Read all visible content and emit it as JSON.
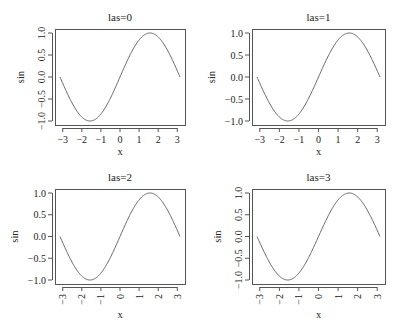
{
  "figure": {
    "width": 398,
    "height": 332,
    "background": "#ffffff",
    "line_color": "#666666",
    "axis_color": "#555555"
  },
  "chart_data": [
    {
      "type": "line",
      "title": "las=0",
      "xlabel": "x",
      "ylabel": "sin",
      "function": "sin(x)",
      "xlim": [
        -3.14159,
        3.14159
      ],
      "ylim": [
        -1,
        1
      ],
      "x_ticks": [
        "-3",
        "-2",
        "-1",
        "0",
        "1",
        "2",
        "3"
      ],
      "y_ticks": [
        "-1.0",
        "-0.5",
        "0.0",
        "0.5",
        "1.0"
      ],
      "las": 0,
      "x_tick_orientation": "parallel",
      "y_tick_orientation": "parallel",
      "grid": false,
      "legend": null
    },
    {
      "type": "line",
      "title": "las=1",
      "xlabel": "x",
      "ylabel": "sin",
      "function": "sin(x)",
      "xlim": [
        -3.14159,
        3.14159
      ],
      "ylim": [
        -1,
        1
      ],
      "x_ticks": [
        "-3",
        "-2",
        "-1",
        "0",
        "1",
        "2",
        "3"
      ],
      "y_ticks": [
        "-1.0",
        "-0.5",
        "0.0",
        "0.5",
        "1.0"
      ],
      "las": 1,
      "x_tick_orientation": "horizontal",
      "y_tick_orientation": "horizontal",
      "grid": false,
      "legend": null
    },
    {
      "type": "line",
      "title": "las=2",
      "xlabel": "x",
      "ylabel": "sin",
      "function": "sin(x)",
      "xlim": [
        -3.14159,
        3.14159
      ],
      "ylim": [
        -1,
        1
      ],
      "x_ticks": [
        "-3",
        "-2",
        "-1",
        "0",
        "1",
        "2",
        "3"
      ],
      "y_ticks": [
        "-1.0",
        "-0.5",
        "0.0",
        "0.5",
        "1.0"
      ],
      "las": 2,
      "x_tick_orientation": "perpendicular",
      "y_tick_orientation": "perpendicular",
      "grid": false,
      "legend": null
    },
    {
      "type": "line",
      "title": "las=3",
      "xlabel": "x",
      "ylabel": "sin",
      "function": "sin(x)",
      "xlim": [
        -3.14159,
        3.14159
      ],
      "ylim": [
        -1,
        1
      ],
      "x_ticks": [
        "-3",
        "-2",
        "-1",
        "0",
        "1",
        "2",
        "3"
      ],
      "y_ticks": [
        "-1.0",
        "-0.5",
        "0.0",
        "0.5",
        "1.0"
      ],
      "las": 3,
      "x_tick_orientation": "vertical",
      "y_tick_orientation": "vertical",
      "grid": false,
      "legend": null
    }
  ]
}
